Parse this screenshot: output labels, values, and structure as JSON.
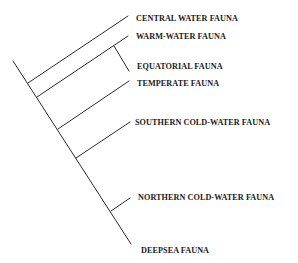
{
  "diagram": {
    "type": "cladogram",
    "ink_color": "#2a2a2a",
    "text_color": "#1a1a1a",
    "background": "#ffffff",
    "leaves": [
      {
        "id": "central",
        "label": "CENTRAL WATER FAUNA"
      },
      {
        "id": "warm",
        "label": "WARM-WATER FAUNA"
      },
      {
        "id": "equatorial",
        "label": "EQUATORIAL FAUNA"
      },
      {
        "id": "temperate",
        "label": "TEMPERATE FAUNA"
      },
      {
        "id": "southern",
        "label": "SOUTHERN COLD-WATER FAUNA"
      },
      {
        "id": "northern",
        "label": "NORTHERN COLD-WATER FAUNA"
      },
      {
        "id": "deepsea",
        "label": "DEEPSEA FAUNA"
      }
    ]
  }
}
